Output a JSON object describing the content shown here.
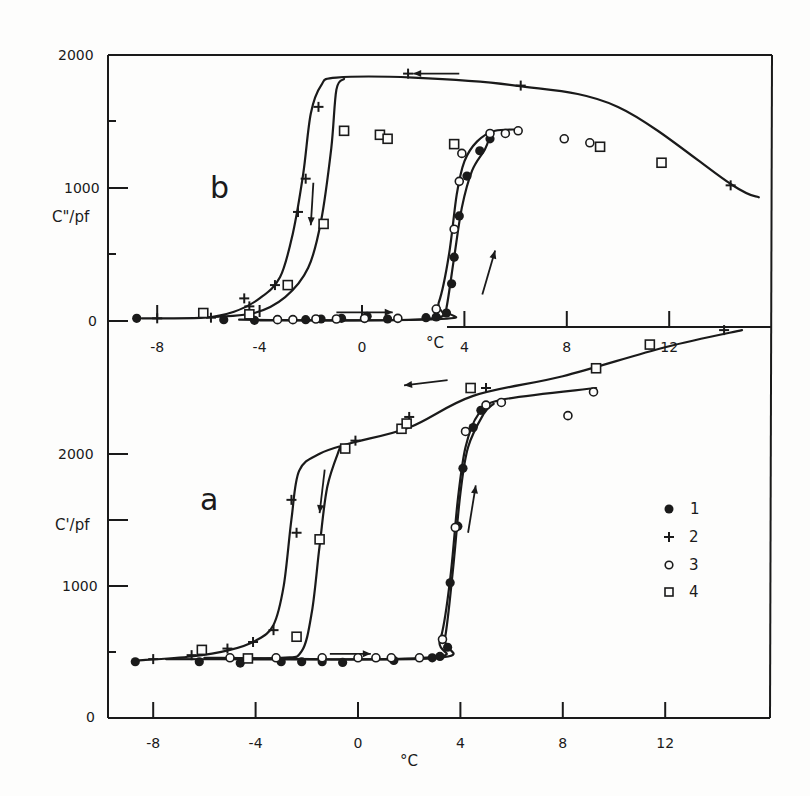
{
  "chart_data": [
    {
      "id": "b",
      "type": "scatter",
      "panel_label": "b",
      "title": "",
      "xlabel": "°C",
      "ylabel": "C\"/pf",
      "xlim": [
        -10,
        15.7
      ],
      "ylim": [
        0,
        2000
      ],
      "x_ticks": [
        -8,
        -4,
        0,
        4,
        8,
        12
      ],
      "x_tick_labels": [
        "-8",
        "-4",
        "0",
        "4",
        "8",
        "12"
      ],
      "y_ticks": [
        0,
        500,
        1000,
        1500,
        2000
      ],
      "y_tick_labels": [
        "0",
        "",
        "1000",
        "",
        "2000"
      ],
      "grid": false,
      "arrows": [
        {
          "direction": "right",
          "x": [
            -1.0,
            1.2
          ],
          "y": [
            65,
            65
          ]
        },
        {
          "direction": "left",
          "x": [
            3.8,
            2.0
          ],
          "y": [
            1860,
            1860
          ]
        },
        {
          "direction": "down",
          "x": [
            -1.9,
            -2.0
          ],
          "y": [
            1040,
            720
          ]
        },
        {
          "direction": "up",
          "x": [
            4.7,
            5.2
          ],
          "y": [
            200,
            530
          ]
        }
      ],
      "series": [
        {
          "name": "1",
          "marker": "filled-circle",
          "direction": "warming",
          "points": [
            [
              -8.8,
              20
            ],
            [
              -5.4,
              10
            ],
            [
              -4.2,
              5
            ],
            [
              -2.2,
              10
            ],
            [
              -1.6,
              15
            ],
            [
              -0.8,
              20
            ],
            [
              0.2,
              35
            ],
            [
              1.0,
              15
            ],
            [
              2.5,
              25
            ],
            [
              2.9,
              30
            ],
            [
              3.3,
              60
            ],
            [
              3.5,
              280
            ],
            [
              3.6,
              480
            ],
            [
              3.8,
              790
            ],
            [
              4.1,
              1090
            ],
            [
              4.6,
              1280
            ],
            [
              5.0,
              1370
            ]
          ]
        },
        {
          "name": "2",
          "marker": "plus",
          "direction": "cooling",
          "points": [
            [
              -8.0,
              20
            ],
            [
              -5.9,
              25
            ],
            [
              -4.4,
              110
            ],
            [
              -4.6,
              170
            ],
            [
              -3.4,
              270
            ],
            [
              -2.5,
              820
            ],
            [
              -2.2,
              1070
            ],
            [
              -1.7,
              1610
            ],
            [
              1.8,
              1860
            ],
            [
              6.2,
              1770
            ],
            [
              14.4,
              1020
            ]
          ]
        },
        {
          "name": "3",
          "marker": "open-circle",
          "direction": "warming",
          "points": [
            [
              -3.3,
              10
            ],
            [
              -2.7,
              10
            ],
            [
              -1.8,
              15
            ],
            [
              -1.0,
              15
            ],
            [
              0.1,
              20
            ],
            [
              1.4,
              20
            ],
            [
              2.9,
              90
            ],
            [
              3.6,
              690
            ],
            [
              3.8,
              1050
            ],
            [
              3.9,
              1260
            ],
            [
              5.0,
              1410
            ],
            [
              5.6,
              1410
            ],
            [
              6.1,
              1430
            ],
            [
              7.9,
              1370
            ],
            [
              8.9,
              1340
            ]
          ]
        },
        {
          "name": "4",
          "marker": "open-square",
          "direction": "cooling",
          "points": [
            [
              -6.2,
              60
            ],
            [
              -4.4,
              50
            ],
            [
              -2.9,
              270
            ],
            [
              -1.5,
              730
            ],
            [
              -0.7,
              1430
            ],
            [
              0.7,
              1400
            ],
            [
              1.0,
              1370
            ],
            [
              3.6,
              1330
            ],
            [
              9.3,
              1310
            ],
            [
              11.7,
              1190
            ]
          ]
        }
      ],
      "curves": [
        {
          "name": "cooling-plus",
          "points": [
            [
              -8.6,
              20
            ],
            [
              -6.2,
              25
            ],
            [
              -5.0,
              70
            ],
            [
              -4.0,
              170
            ],
            [
              -3.2,
              330
            ],
            [
              -2.7,
              660
            ],
            [
              -2.3,
              1100
            ],
            [
              -2.0,
              1560
            ],
            [
              -1.6,
              1770
            ],
            [
              -1.0,
              1830
            ],
            [
              2.0,
              1830
            ],
            [
              6.0,
              1770
            ],
            [
              10.0,
              1610
            ],
            [
              14.4,
              1030
            ],
            [
              15.5,
              930
            ]
          ]
        },
        {
          "name": "cooling-square",
          "points": [
            [
              -5.8,
              30
            ],
            [
              -4.2,
              60
            ],
            [
              -3.0,
              180
            ],
            [
              -2.1,
              400
            ],
            [
              -1.6,
              750
            ],
            [
              -1.2,
              1300
            ],
            [
              -1.0,
              1740
            ],
            [
              -0.7,
              1820
            ]
          ]
        },
        {
          "name": "warming-circle",
          "points": [
            [
              -4.8,
              10
            ],
            [
              2.5,
              15
            ],
            [
              3.0,
              140
            ],
            [
              3.4,
              500
            ],
            [
              3.7,
              950
            ],
            [
              4.0,
              1200
            ],
            [
              4.5,
              1350
            ],
            [
              5.2,
              1430
            ],
            [
              6.2,
              1440
            ]
          ]
        },
        {
          "name": "warming-filled",
          "points": [
            [
              -4.0,
              5
            ],
            [
              3.1,
              15
            ],
            [
              3.3,
              100
            ],
            [
              3.6,
              480
            ],
            [
              3.9,
              850
            ],
            [
              4.3,
              1130
            ],
            [
              4.8,
              1290
            ],
            [
              5.0,
              1390
            ]
          ]
        }
      ]
    },
    {
      "id": "a",
      "type": "scatter",
      "panel_label": "a",
      "title": "",
      "xlabel": "°C",
      "ylabel": "C'/pf",
      "xlim": [
        -9.7,
        16.0
      ],
      "ylim": [
        0,
        2900
      ],
      "x_ticks": [
        -8,
        -4,
        0,
        4,
        8,
        12
      ],
      "x_tick_labels": [
        "-8",
        "-4",
        "0",
        "4",
        "8",
        "12"
      ],
      "y_ticks": [
        0,
        500,
        1000,
        1500,
        2000
      ],
      "y_tick_labels": [
        "0",
        "",
        "1000",
        "",
        "2000"
      ],
      "grid": false,
      "arrows": [
        {
          "direction": "right",
          "x": [
            -1.1,
            0.5
          ],
          "y": [
            480,
            480
          ]
        },
        {
          "direction": "left",
          "x": [
            3.5,
            1.8
          ],
          "y": [
            2560,
            2520
          ]
        },
        {
          "direction": "down",
          "x": [
            -1.3,
            -1.5
          ],
          "y": [
            1880,
            1550
          ]
        },
        {
          "direction": "up",
          "x": [
            4.3,
            4.6
          ],
          "y": [
            1400,
            1760
          ]
        }
      ],
      "series": [
        {
          "name": "1",
          "marker": "filled-circle",
          "direction": "warming",
          "points": [
            [
              -8.7,
              420
            ],
            [
              -6.2,
              420
            ],
            [
              -4.6,
              410
            ],
            [
              -3.0,
              420
            ],
            [
              -2.2,
              420
            ],
            [
              -1.4,
              420
            ],
            [
              -0.6,
              415
            ],
            [
              1.4,
              430
            ],
            [
              2.9,
              450
            ],
            [
              3.2,
              460
            ],
            [
              3.5,
              530
            ],
            [
              3.6,
              1020
            ],
            [
              3.9,
              1450
            ],
            [
              4.1,
              1890
            ],
            [
              4.5,
              2200
            ],
            [
              4.8,
              2330
            ]
          ]
        },
        {
          "name": "2",
          "marker": "plus",
          "direction": "cooling",
          "points": [
            [
              -8.0,
              440
            ],
            [
              -6.5,
              470
            ],
            [
              -5.1,
              520
            ],
            [
              -4.1,
              570
            ],
            [
              -3.3,
              660
            ],
            [
              -2.6,
              1650
            ],
            [
              -2.4,
              1400
            ],
            [
              -0.1,
              2100
            ],
            [
              2.0,
              2280
            ],
            [
              5.0,
              2500
            ],
            [
              14.3,
              2940
            ]
          ]
        },
        {
          "name": "3",
          "marker": "open-circle",
          "direction": "warming",
          "points": [
            [
              -5.0,
              450
            ],
            [
              -3.2,
              450
            ],
            [
              -1.4,
              450
            ],
            [
              0.0,
              450
            ],
            [
              0.7,
              450
            ],
            [
              1.3,
              450
            ],
            [
              2.4,
              450
            ],
            [
              3.3,
              590
            ],
            [
              3.8,
              1440
            ],
            [
              4.2,
              2170
            ],
            [
              5.0,
              2370
            ],
            [
              5.6,
              2390
            ],
            [
              8.2,
              2290
            ],
            [
              9.2,
              2470
            ]
          ]
        },
        {
          "name": "4",
          "marker": "open-square",
          "direction": "cooling",
          "points": [
            [
              -6.1,
              510
            ],
            [
              -4.3,
              445
            ],
            [
              -2.4,
              610
            ],
            [
              -1.5,
              1350
            ],
            [
              -0.5,
              2040
            ],
            [
              1.7,
              2190
            ],
            [
              1.9,
              2230
            ],
            [
              4.4,
              2500
            ],
            [
              9.3,
              2650
            ],
            [
              11.4,
              2830
            ]
          ]
        }
      ],
      "curves": [
        {
          "name": "cooling-plus",
          "points": [
            [
              -8.6,
              430
            ],
            [
              -6.5,
              460
            ],
            [
              -5.0,
              510
            ],
            [
              -4.0,
              580
            ],
            [
              -3.3,
              700
            ],
            [
              -2.9,
              1000
            ],
            [
              -2.6,
              1500
            ],
            [
              -2.3,
              1870
            ],
            [
              -1.5,
              2000
            ],
            [
              -0.3,
              2080
            ],
            [
              2.0,
              2200
            ],
            [
              4.5,
              2440
            ],
            [
              8.0,
              2590
            ],
            [
              12.0,
              2810
            ],
            [
              15.0,
              2940
            ]
          ]
        },
        {
          "name": "cooling-square",
          "points": [
            [
              -6.0,
              450
            ],
            [
              -3.0,
              450
            ],
            [
              -2.2,
              500
            ],
            [
              -1.8,
              800
            ],
            [
              -1.5,
              1300
            ],
            [
              -1.2,
              1750
            ],
            [
              -0.7,
              2050
            ]
          ]
        },
        {
          "name": "warming-circle",
          "points": [
            [
              -7.5,
              440
            ],
            [
              2.5,
              450
            ],
            [
              3.2,
              580
            ],
            [
              3.6,
              1050
            ],
            [
              3.9,
              1650
            ],
            [
              4.2,
              2050
            ],
            [
              4.7,
              2300
            ],
            [
              5.6,
              2410
            ],
            [
              9.3,
              2500
            ]
          ]
        },
        {
          "name": "warming-filled",
          "points": [
            [
              -4.3,
              445
            ],
            [
              3.1,
              450
            ],
            [
              3.4,
              600
            ],
            [
              3.7,
              1100
            ],
            [
              4.0,
              1700
            ],
            [
              4.3,
              2050
            ],
            [
              4.9,
              2300
            ],
            [
              5.3,
              2380
            ]
          ]
        }
      ]
    }
  ],
  "legend": {
    "position": "right-middle of panel a",
    "entries": [
      {
        "marker": "filled-circle",
        "label": "1"
      },
      {
        "marker": "plus",
        "label": "2"
      },
      {
        "marker": "open-circle",
        "label": "3"
      },
      {
        "marker": "open-square",
        "label": "4"
      }
    ]
  },
  "labels": {
    "panel_b": "b",
    "panel_a": "a",
    "ylabel_b": "C\"/pf",
    "ylabel_a": "C'/pf",
    "xlabel_b": "°C",
    "xlabel_a": "°C",
    "yticks_b": [
      "2000",
      "1000",
      "0"
    ],
    "yticks_a": [
      "2000",
      "1000",
      "0"
    ],
    "xticks_b": [
      "-8",
      "-4",
      "0",
      "4",
      "8",
      "12"
    ],
    "xticks_a": [
      "-8",
      "-4",
      "0",
      "4",
      "8",
      "12"
    ],
    "legend_1": "1",
    "legend_2": "2",
    "legend_3": "3",
    "legend_4": "4"
  },
  "colors": {
    "ink": "#1a1a1a",
    "paper": "#fdfdfc"
  }
}
